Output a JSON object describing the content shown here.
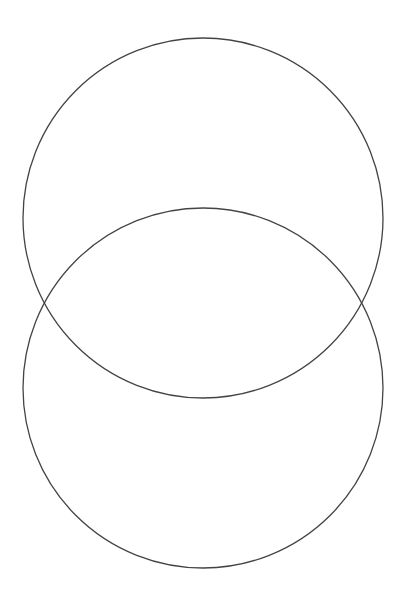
{
  "diagram": {
    "type": "venn",
    "background": "#ffffff",
    "stroke_color": "#444444",
    "circles": [
      {
        "id": "top",
        "cx": 203,
        "cy": 218,
        "r": 180,
        "label": ""
      },
      {
        "id": "bottom",
        "cx": 203,
        "cy": 388,
        "r": 180,
        "label": ""
      }
    ],
    "intersection_points": [
      {
        "x": 44,
        "y": 303
      },
      {
        "x": 362,
        "y": 303
      }
    ]
  }
}
